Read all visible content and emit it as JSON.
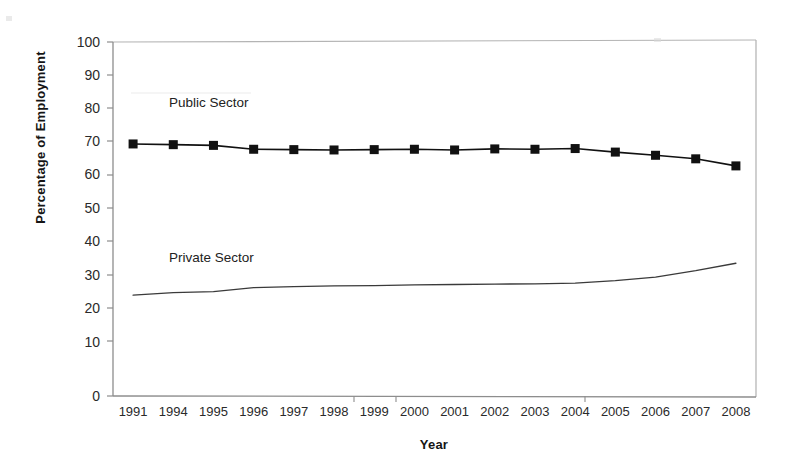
{
  "chart_data": {
    "type": "line",
    "title": "",
    "xlabel": "Year",
    "ylabel": "Percentage of Employment",
    "categories": [
      "1991",
      "1994",
      "1995",
      "1996",
      "1997",
      "1998",
      "1999",
      "2000",
      "2001",
      "2002",
      "2003",
      "2004",
      "2005",
      "2006",
      "2007",
      "2008"
    ],
    "ylim": [
      0,
      100
    ],
    "y_ticks": [
      "0",
      "10",
      "20",
      "30",
      "40",
      "50",
      "60",
      "70",
      "80",
      "90",
      "100"
    ],
    "grid": false,
    "legend_position": "inline-annotations",
    "series": [
      {
        "name": "Public Sector",
        "marker": "filled-square",
        "color": "#111111",
        "values": [
          71.2,
          71.0,
          70.8,
          69.7,
          69.6,
          69.5,
          69.6,
          69.7,
          69.5,
          69.8,
          69.7,
          69.9,
          68.9,
          68.0,
          67.0,
          65.0
        ]
      },
      {
        "name": "Private Sector",
        "marker": "none",
        "color": "#3a3a3a",
        "values": [
          28.5,
          29.2,
          29.5,
          30.6,
          30.9,
          31.1,
          31.2,
          31.4,
          31.5,
          31.6,
          31.7,
          31.9,
          32.6,
          33.6,
          35.4,
          37.5
        ]
      }
    ],
    "annotations": [
      {
        "text": "Public Sector",
        "x_pct": 25,
        "y_value": 80
      },
      {
        "text": "Private Sector",
        "x_pct": 25,
        "y_value": 40
      }
    ]
  },
  "axes": {
    "y_title": "Percentage of Employment",
    "x_title": "Year",
    "y_tick_labels": [
      "100",
      "90",
      "80",
      "70",
      "60",
      "50",
      "40",
      "30",
      "20",
      "10",
      "0"
    ],
    "x_tick_labels": [
      "1991",
      "1994",
      "1995",
      "1996",
      "1997",
      "1998",
      "1999",
      "2000",
      "2001",
      "2002",
      "2003",
      "2004",
      "2005",
      "2006",
      "2007",
      "2008"
    ]
  },
  "labels": {
    "public_sector": "Public Sector",
    "private_sector": "Private Sector"
  },
  "colors": {
    "public_series": "#111111",
    "private_series": "#3a3a3a",
    "axis": "#8a8a8a",
    "text": "#1a1a1a",
    "background": "#ffffff"
  }
}
